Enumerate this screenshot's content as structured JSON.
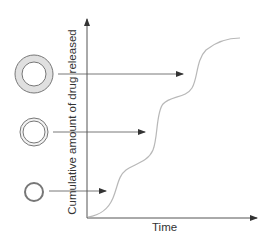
{
  "diagram": {
    "y_axis_label": "Cumulative amount of drug released",
    "x_axis_label": "Time",
    "particles": [
      {
        "name": "large-coated-particle",
        "description": "thick shell",
        "points_to": "third release step"
      },
      {
        "name": "medium-coated-particle",
        "description": "medium shell",
        "points_to": "second release step"
      },
      {
        "name": "small-coated-particle",
        "description": "thin shell",
        "points_to": "first release step"
      }
    ],
    "colors": {
      "axis": "#555555",
      "curve": "#b8b8b8",
      "shell_fill": "#e0e0e0",
      "outline": "#777777"
    }
  }
}
